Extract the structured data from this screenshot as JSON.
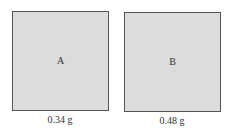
{
  "samples": [
    {
      "label": "A",
      "mass": "0.34 g",
      "box": {
        "left": 12,
        "top": 11,
        "width": 97,
        "height": 100
      },
      "mass_label_center_x": 60,
      "mass_label_top": 114
    },
    {
      "label": "B",
      "mass": "0.48 g",
      "box": {
        "left": 124,
        "top": 12,
        "width": 97,
        "height": 100
      },
      "mass_label_center_x": 172,
      "mass_label_top": 115
    }
  ],
  "colors": {
    "box_fill": "#dcdcdc",
    "box_border": "#555555",
    "text": "#333333"
  }
}
